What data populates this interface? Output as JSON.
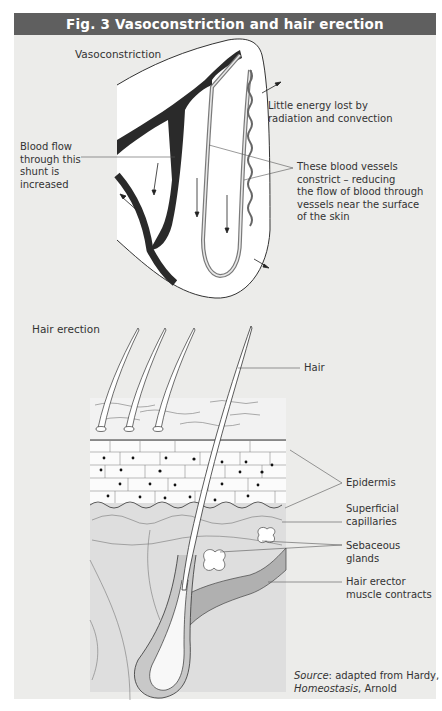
{
  "figure": {
    "title": "Fig. 3  Vasoconstriction and hair erection",
    "colors": {
      "title_bar": "#5f5f5f",
      "panel": "#ececea",
      "vessel_dark": "#2a2a2a",
      "vessel_grey": "#9a9a9a",
      "muscle": "#b0b0b0"
    }
  },
  "vasoconstriction": {
    "heading": "Vasoconstriction",
    "labels": {
      "shunt": [
        "Blood flow",
        "through this",
        "shunt is",
        "increased"
      ],
      "energy": [
        "Little energy lost by",
        "radiation and convection"
      ],
      "vessels": [
        "These blood vessels",
        "constrict – reducing",
        "the flow of blood through",
        "vessels near the surface",
        "of the skin"
      ]
    }
  },
  "hair_erection": {
    "heading": "Hair erection",
    "labels": {
      "hair": "Hair",
      "epidermis": "Epidermis",
      "capillaries": [
        "Superficial",
        "capillaries"
      ],
      "glands": [
        "Sebaceous",
        "glands"
      ],
      "muscle": [
        "Hair erector",
        "muscle contracts"
      ]
    }
  },
  "source": {
    "prefix": "Source",
    "text1": ": adapted from Hardy,",
    "book": "Homeostasis",
    "text2": ", Arnold"
  }
}
